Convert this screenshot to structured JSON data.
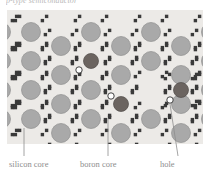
{
  "figure": {
    "top_caption": "p-type semiconductor",
    "panel": {
      "background_color": "#eceae7",
      "width": 196,
      "height": 134
    },
    "colors": {
      "silicon_core": "#a9a9a9",
      "silicon_core_stroke": "#8f8f8f",
      "boron_core": "#6b6460",
      "boron_core_stroke": "#4f4a47",
      "bond_electron": "#3a3a3a",
      "hole_fill": "#ffffff",
      "hole_stroke": "#2f2f2f",
      "leader_line": "#8d8d8d",
      "label_text": "#8d8d8d"
    },
    "labels": [
      {
        "id": "silicon-core",
        "text": "silicon core"
      },
      {
        "id": "boron-core",
        "text": "boron core"
      },
      {
        "id": "hole",
        "text": "hole"
      }
    ],
    "legend_leaders": [
      {
        "id": "silicon-core-leader",
        "x1": 24,
        "y1": 128,
        "x2": 24,
        "y2": 156
      },
      {
        "id": "boron-core-leader",
        "x1": 108,
        "y1": 118,
        "x2": 108,
        "y2": 156
      },
      {
        "id": "hole-leader",
        "x1": 170,
        "y1": 104,
        "x2": 178,
        "y2": 156
      }
    ]
  },
  "chart_data": {
    "type": "diagram",
    "lattice": {
      "spacing_x": 30,
      "spacing_y": 29,
      "origin_x": 24,
      "origin_y": 22,
      "core_radius": 9.5,
      "boron_radius": 7.5,
      "hole_radius": 3.2,
      "bond_square_size": 3.4
    },
    "silicon_cores": [
      [
        24,
        22
      ],
      [
        84,
        22
      ],
      [
        144,
        22
      ],
      [
        204,
        22
      ],
      [
        -6,
        22
      ],
      [
        54,
        36
      ],
      [
        114,
        36
      ],
      [
        174,
        36
      ],
      [
        234,
        36
      ],
      [
        -36,
        36
      ],
      [
        24,
        51
      ],
      [
        144,
        51
      ],
      [
        204,
        51
      ],
      [
        -6,
        51
      ],
      [
        54,
        65
      ],
      [
        114,
        65
      ],
      [
        174,
        65
      ],
      [
        234,
        65
      ],
      [
        -36,
        65
      ],
      [
        24,
        80
      ],
      [
        84,
        80
      ],
      [
        204,
        80
      ],
      [
        -6,
        80
      ],
      [
        54,
        94
      ],
      [
        174,
        94
      ],
      [
        234,
        94
      ],
      [
        -36,
        94
      ],
      [
        24,
        109
      ],
      [
        84,
        109
      ],
      [
        144,
        109
      ],
      [
        204,
        109
      ],
      [
        -6,
        109
      ],
      [
        54,
        123
      ],
      [
        114,
        123
      ],
      [
        174,
        123
      ],
      [
        234,
        123
      ],
      [
        -36,
        123
      ]
    ],
    "boron_cores": [
      [
        84,
        51
      ],
      [
        114,
        94
      ],
      [
        174,
        80
      ]
    ],
    "holes": [
      [
        72,
        60
      ],
      [
        104,
        86
      ],
      [
        163,
        90
      ]
    ],
    "legend": [
      "silicon core",
      "boron core",
      "hole"
    ],
    "annotations": [
      {
        "label": "silicon core",
        "points_to": [
          24,
          128
        ]
      },
      {
        "label": "boron core",
        "points_to": [
          108,
          118
        ]
      },
      {
        "label": "hole",
        "points_to": [
          170,
          104
        ]
      }
    ]
  }
}
